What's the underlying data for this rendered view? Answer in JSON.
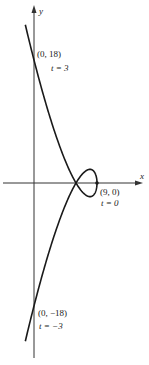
{
  "diagram": {
    "type": "parametric-curve",
    "equations": {
      "x": "9 - t^2",
      "y": "t^3 - 3t"
    },
    "t_range": [
      -3.2,
      3.2
    ],
    "scale": {
      "origin_px": [
        34,
        183
      ],
      "x_px_per_unit": 7,
      "y_px_per_unit": 6.83
    },
    "axes": {
      "x_label": "x",
      "y_label": "y"
    },
    "points": [
      {
        "coord": "(0, 18)",
        "param": "t = 3",
        "x": 0,
        "y": 18
      },
      {
        "coord": "(9, 0)",
        "param": "t = 0",
        "x": 9,
        "y": 0
      },
      {
        "coord": "(0, −18)",
        "param": "t = −3",
        "x": 0,
        "y": -18
      }
    ],
    "colors": {
      "curve": "#1a1a1a",
      "axes": "#333333",
      "background": "#ffffff"
    }
  }
}
